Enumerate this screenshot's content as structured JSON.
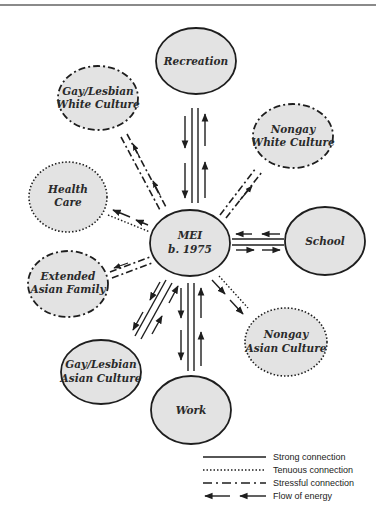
{
  "diagram": {
    "type": "ecomap",
    "center": {
      "id": "mei",
      "lines": [
        "MEI",
        "b. 1975"
      ]
    },
    "nodes": [
      {
        "id": "recreation",
        "lines": [
          "Recreation"
        ],
        "border": "strong"
      },
      {
        "id": "gl-white",
        "lines": [
          "Gay/Lesbian",
          "White Culture"
        ],
        "border": "stressful"
      },
      {
        "id": "nongay-white",
        "lines": [
          "Nongay",
          "White Culture"
        ],
        "border": "stressful"
      },
      {
        "id": "health-care",
        "lines": [
          "Health",
          "Care"
        ],
        "border": "tenuous"
      },
      {
        "id": "school",
        "lines": [
          "School"
        ],
        "border": "strong"
      },
      {
        "id": "ext-family",
        "lines": [
          "Extended",
          "Asian Family"
        ],
        "border": "stressful"
      },
      {
        "id": "gl-asian",
        "lines": [
          "Gay/Lesbian",
          "Asian Culture"
        ],
        "border": "strong"
      },
      {
        "id": "nongay-asian",
        "lines": [
          "Nongay",
          "Asian Culture"
        ],
        "border": "tenuous"
      },
      {
        "id": "work",
        "lines": [
          "Work"
        ],
        "border": "strong"
      }
    ],
    "connections": [
      {
        "to": "recreation",
        "style": "strong",
        "energy": "both"
      },
      {
        "to": "gl-white",
        "style": "stressful",
        "energy": "to-node"
      },
      {
        "to": "nongay-white",
        "style": "stressful",
        "energy": "to-node"
      },
      {
        "to": "health-care",
        "style": "tenuous",
        "energy": "to-node"
      },
      {
        "to": "school",
        "style": "strong",
        "energy": "both"
      },
      {
        "to": "ext-family",
        "style": "stressful",
        "energy": "to-node"
      },
      {
        "to": "gl-asian",
        "style": "strong",
        "energy": "both"
      },
      {
        "to": "nongay-asian",
        "style": "tenuous",
        "energy": "to-node"
      },
      {
        "to": "work",
        "style": "strong",
        "energy": "both"
      }
    ]
  },
  "legend": {
    "items": [
      {
        "style": "strong",
        "label": "Strong connection"
      },
      {
        "style": "tenuous",
        "label": "Tenuous connection"
      },
      {
        "style": "stressful",
        "label": "Stressful connection"
      },
      {
        "style": "flow",
        "label": "Flow of energy"
      }
    ]
  },
  "colors": {
    "node_fill": "#e3e3e3",
    "stroke": "#1e1e1e",
    "rule": "#8a8a8a"
  }
}
